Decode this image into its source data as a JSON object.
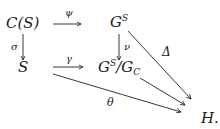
{
  "diagram": {
    "type": "commutative-diagram",
    "nodes": {
      "cs": {
        "text": "C(S)"
      },
      "gs": {
        "base": "G",
        "sup": "S"
      },
      "s": {
        "text": "S"
      },
      "quot": {
        "base": "G",
        "sup": "S",
        "slash": "/G",
        "sub": "C"
      },
      "h": {
        "text": "H."
      }
    },
    "arrows": {
      "psi": {
        "label": "ψ",
        "from": "C(S)",
        "to": "G^S"
      },
      "sigma": {
        "label": "σ",
        "from": "C(S)",
        "to": "S"
      },
      "nu": {
        "label": "ν",
        "from": "G^S",
        "to": "G^S/G_C"
      },
      "gamma": {
        "label": "γ",
        "from": "S",
        "to": "G^S/G_C"
      },
      "delta": {
        "label": "Δ",
        "from": "G^S",
        "to": "H"
      },
      "theta": {
        "label": "θ",
        "from": "S",
        "to": "H"
      },
      "quot_to_h": {
        "label": "",
        "from": "G^S/G_C",
        "to": "H"
      }
    }
  }
}
